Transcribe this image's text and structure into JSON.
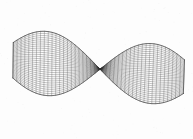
{
  "figure": {
    "title": "",
    "caption": "",
    "background_color": "#fdfdfd",
    "ink_color": "#2b2b2b",
    "width": 193,
    "height": 139
  },
  "chart_data": {
    "type": "line",
    "render_style": "wireframe-mesh-surface",
    "title": "",
    "subtitle": "",
    "xlabel": "",
    "ylabel": "",
    "zlabel": "",
    "grid": true,
    "axes_visible": false,
    "legend": [],
    "legend_position": "none",
    "surface_equation": "z = sin(u) * cos(v) twisted ruled surface",
    "mesh": {
      "u_divisions": 44,
      "v_divisions": 30,
      "line_width_px": 0.35,
      "cell_size_px": 2.0
    },
    "xlim": [
      -2.6,
      2.6
    ],
    "ylim": [
      -1.6,
      1.6
    ],
    "zlim": [
      -1.0,
      1.0
    ],
    "features": [
      {
        "name": "left-lobe-tip",
        "x_px": 13,
        "y_px": 42
      },
      {
        "name": "left-waist-node",
        "x_px": 52,
        "y_px": 70
      },
      {
        "name": "panel-top-left-corner",
        "x_px": 70,
        "y_px": 14
      },
      {
        "name": "panel-top-right-corner",
        "x_px": 128,
        "y_px": 26
      },
      {
        "name": "panel-bottom-left-corner",
        "x_px": 72,
        "y_px": 121
      },
      {
        "name": "panel-bottom-right-corner",
        "x_px": 132,
        "y_px": 108
      },
      {
        "name": "right-waist-node",
        "x_px": 148,
        "y_px": 68
      },
      {
        "name": "right-lobe-tip",
        "x_px": 184,
        "y_px": 96
      }
    ],
    "series": [
      {
        "name": "left-lobe",
        "values": [
          13,
          42,
          52,
          70,
          40,
          62,
          30,
          52
        ]
      },
      {
        "name": "central-panel",
        "values": [
          70,
          14,
          128,
          26,
          148,
          68,
          132,
          108,
          72,
          121,
          52,
          70
        ]
      },
      {
        "name": "right-lobe",
        "values": [
          148,
          68,
          184,
          96,
          170,
          80,
          160,
          72
        ]
      }
    ]
  }
}
